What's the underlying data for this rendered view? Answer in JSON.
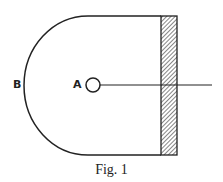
{
  "figure": {
    "caption": "Fig. 1",
    "labels": {
      "a": "A",
      "b": "B"
    },
    "stroke_color": "#222222",
    "elements": [
      "semicircular-boundary",
      "hatched-wall",
      "small-circle-A",
      "line-from-A"
    ]
  }
}
